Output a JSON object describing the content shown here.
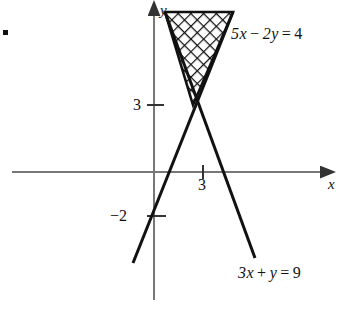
{
  "figure": {
    "type": "math-graph",
    "bullet_marker": "•",
    "axes": {
      "x_label": "x",
      "y_label": "y",
      "origin_px": [
        154,
        172
      ],
      "x_axis_y_px": 172,
      "y_axis_x_px": 154,
      "unit_px_x": 16.3,
      "unit_px_y": 22.2,
      "axis_color": "#777777",
      "arrowheads": [
        "x-positive",
        "y-positive"
      ]
    },
    "tick_labels": [
      {
        "text": "3",
        "axis": "y",
        "value": 3,
        "x_px": 133,
        "y_px": 96
      },
      {
        "text": "−2",
        "axis": "y",
        "value": -2,
        "x_px": 110,
        "y_px": 207
      },
      {
        "text": "3",
        "axis": "x",
        "value": 3,
        "x_px": 198,
        "y_px": 176
      }
    ],
    "lines": [
      {
        "name": "line-5x-2y-4",
        "equation": "5x − 2y = 4",
        "slope": 2.5,
        "y_intercept": -2,
        "x_intercept": 0.8,
        "color": "#111111",
        "label_x_px": 231,
        "label_y_px": 25,
        "label_parts": {
          "lhs1": "5x",
          "op": "−",
          "lhs2": "2y",
          "eq": "=",
          "rhs": "4"
        }
      },
      {
        "name": "line-3x-y-9",
        "equation": "3x + y = 9",
        "slope": -3,
        "y_intercept": 9,
        "x_intercept": 3,
        "color": "#111111",
        "label_x_px": 238,
        "label_y_px": 264,
        "label_parts": {
          "lhs1": "3x",
          "op": "+",
          "lhs2": "y",
          "eq": "=",
          "rhs": "9"
        }
      }
    ],
    "intersection": {
      "x": 2,
      "y": 3,
      "px": [
        193,
        105
      ]
    },
    "shaded_region": {
      "name": "solution-region",
      "pattern": "cross-hatch-diamond",
      "vertices_px": [
        [
          165,
          12
        ],
        [
          233,
          12
        ],
        [
          193,
          105
        ]
      ],
      "outline_color": "#111111",
      "fill_color": "#ffffff"
    }
  }
}
